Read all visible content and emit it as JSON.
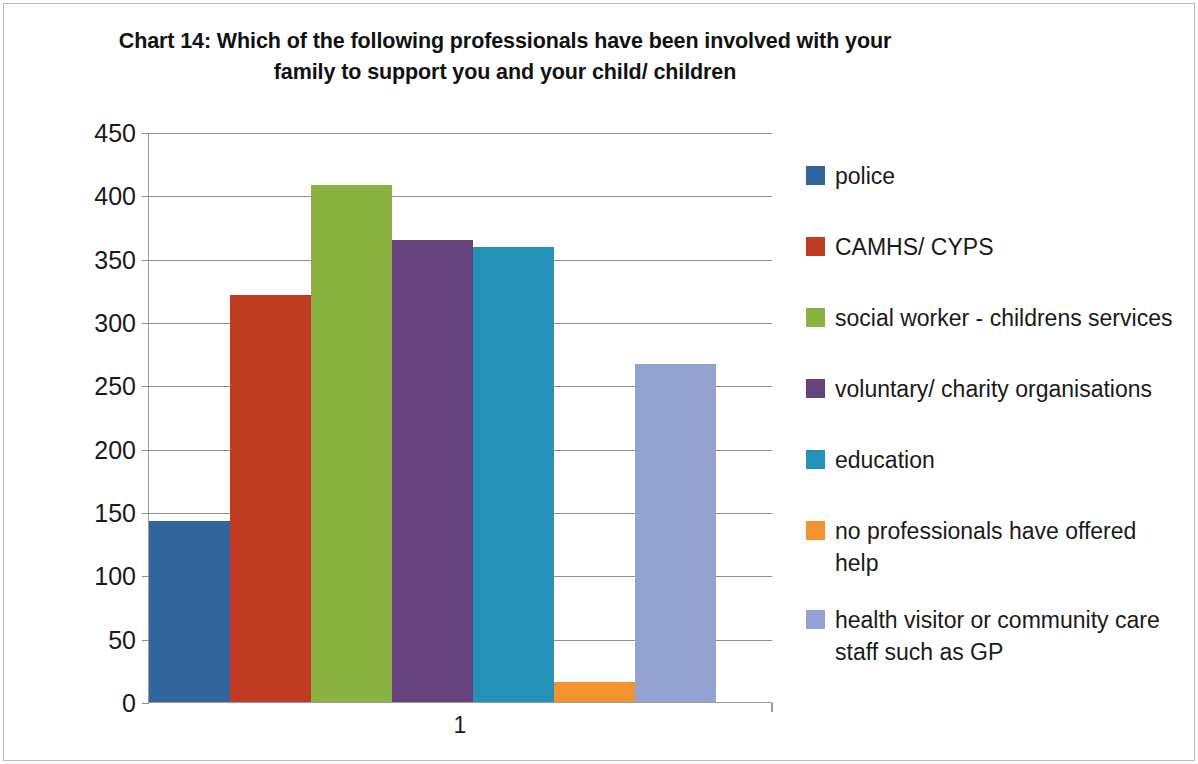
{
  "chart": {
    "title_line1": "Chart 14: Which of the following professionals have been involved with your",
    "title_line2": "family to support you and your child/ children",
    "xtick": "1"
  },
  "chart_data": {
    "type": "bar",
    "title": "Chart 14: Which of the following professionals have been involved with your family to support you and your child/ children",
    "xlabel": "",
    "ylabel": "",
    "categories": [
      "1"
    ],
    "x": [
      "1"
    ],
    "xtick_labels": [
      "1"
    ],
    "ytick_labels": [
      "0",
      "50",
      "100",
      "150",
      "200",
      "250",
      "300",
      "350",
      "400",
      "450"
    ],
    "ylim": [
      0,
      450
    ],
    "ytick_step": 50,
    "grid": "horizontal",
    "legend_position": "right",
    "series": [
      {
        "name": "police",
        "values": [
          143
        ],
        "color": "#31659C"
      },
      {
        "name": "CAMHS/ CYPS",
        "values": [
          321
        ],
        "color": "#BF3C23"
      },
      {
        "name": "social worker - childrens services",
        "values": [
          408
        ],
        "color": "#8AB240"
      },
      {
        "name": "voluntary/ charity organisations",
        "values": [
          365
        ],
        "color": "#67437E"
      },
      {
        "name": "education",
        "values": [
          359
        ],
        "color": "#2491B8"
      },
      {
        "name": "no professionals have offered help",
        "values": [
          16
        ],
        "color": "#F2932F"
      },
      {
        "name": "health visitor or community care staff such as GP",
        "values": [
          267
        ],
        "color": "#93A2D0"
      }
    ]
  },
  "legend": {
    "items": [
      {
        "label": "police",
        "color": "#31659C"
      },
      {
        "label": "CAMHS/ CYPS",
        "color": "#BF3C23"
      },
      {
        "label": "social worker - childrens services",
        "color": "#8AB240"
      },
      {
        "label": "voluntary/ charity organisations",
        "color": "#67437E"
      },
      {
        "label": "education",
        "color": "#2491B8"
      },
      {
        "label": "no professionals have offered help",
        "color": "#F2932F"
      },
      {
        "label": "health visitor or community care staff such as GP",
        "color": "#93A2D0"
      }
    ]
  }
}
